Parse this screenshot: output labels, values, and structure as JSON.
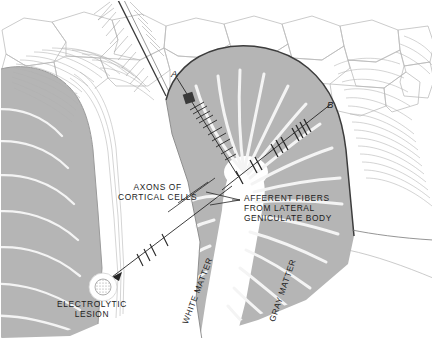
{
  "figure": {
    "type": "anatomical-diagram",
    "background_color": "#ffffff",
    "border_color": "#c8c8c8",
    "gray_matter_color": "#b5b5b5",
    "white_matter_color": "#ffffff",
    "ink_color": "#1c1c1c",
    "fiber_stripe_color": "#f2f2f2"
  },
  "labels": {
    "axons_of_cortical_cells": "AXONS OF\nCORTICAL CELLS",
    "afferent_fibers": "AFFERENT FIBERS\nFROM LATERAL\nGENICULATE BODY",
    "white_matter": "WHITE MATTER",
    "gray_matter": "GRAY MATTER",
    "electrolytic_lesion": "ELECTROLYTIC\nLESION",
    "track_a": "A",
    "track_b": "B"
  },
  "annotations": {
    "track_a_marker": "dark-square-electrode-mark",
    "track_b_marker": "tick-marks-along-track",
    "lesion_marker": "stippled-circle"
  }
}
